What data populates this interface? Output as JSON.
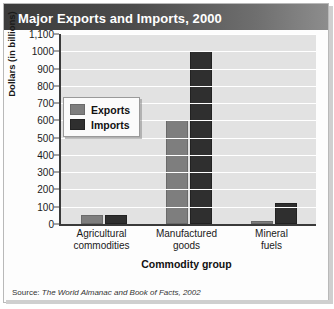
{
  "figure": {
    "title": "Major Exports and Imports, 2000",
    "source_label": "Source:",
    "source_citation": "The World Almanac and Book of Facts, 2002"
  },
  "colors": {
    "exports": "#7e7e7e",
    "imports": "#2f2f2f",
    "title_bar": "#4c4c4c",
    "plot_background": "#e2e2e2",
    "gridline": "#ffffff"
  },
  "legend": {
    "entries": [
      {
        "label": "Exports",
        "color": "#7e7e7e"
      },
      {
        "label": "Imports",
        "color": "#2f2f2f"
      }
    ]
  },
  "axes": {
    "y_title": "Dollars (in billions)",
    "x_title": "Commodity group",
    "y_ticks": [
      "1,100",
      "1000",
      "900",
      "800",
      "700",
      "600",
      "500",
      "400",
      "300",
      "200",
      "100",
      "0"
    ]
  },
  "chart_data": {
    "type": "bar",
    "title": "Major Exports and Imports, 2000",
    "xlabel": "Commodity group",
    "ylabel": "Dollars (in billions)",
    "ylim": [
      0,
      1100
    ],
    "ytick_step": 100,
    "grid": true,
    "legend_position": "inside-upper-left",
    "categories": [
      "Agricultural commodities",
      "Manufactured goods",
      "Mineral fuels"
    ],
    "category_lines": [
      [
        "Agricultural",
        "commodities"
      ],
      [
        "Manufactured",
        "goods"
      ],
      [
        "Mineral",
        "fuels"
      ]
    ],
    "series": [
      {
        "name": "Exports",
        "color": "#7e7e7e",
        "values": [
          50,
          600,
          10
        ]
      },
      {
        "name": "Imports",
        "color": "#2f2f2f",
        "values": [
          50,
          1000,
          120
        ]
      }
    ]
  }
}
